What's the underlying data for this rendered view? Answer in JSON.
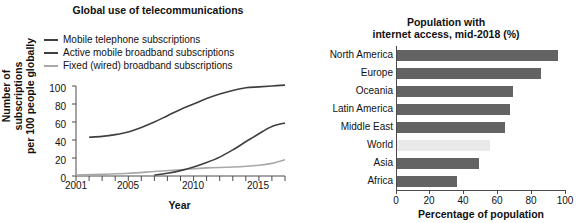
{
  "chart_data": [
    {
      "type": "line",
      "title": "Global use of telecommunications",
      "xlabel": "Year",
      "ylabel": "Number of subscriptions\nper 100 people globally",
      "ylabel_line1": "Number of subscriptions",
      "ylabel_line2": "per 100 people globally",
      "xlim": [
        2001,
        2017
      ],
      "ylim": [
        0,
        100
      ],
      "yticks": [
        100,
        80,
        60,
        40,
        20,
        0
      ],
      "xticks": [
        2001,
        2005,
        2010,
        2015
      ],
      "xtick_all": [
        2001,
        2002,
        2003,
        2004,
        2005,
        2006,
        2007,
        2008,
        2009,
        2010,
        2011,
        2012,
        2013,
        2014,
        2015,
        2016,
        2017
      ],
      "grid": false,
      "legend_position": "above-plot",
      "series": [
        {
          "name": "Mobile telephone subscriptions",
          "color": "#3f3f3f",
          "x": [
            2002,
            2003,
            2004,
            2005,
            2006,
            2007,
            2008,
            2009,
            2010,
            2011,
            2012,
            2013,
            2014,
            2015,
            2016,
            2017
          ],
          "values": [
            43,
            44,
            46,
            49,
            54,
            60,
            67,
            74,
            80,
            86,
            91,
            95,
            98,
            99,
            100,
            101
          ]
        },
        {
          "name": "Active mobile broadband subscriptions",
          "color": "#3f3f3f",
          "x": [
            2007,
            2008,
            2009,
            2010,
            2011,
            2012,
            2013,
            2014,
            2015,
            2016,
            2017
          ],
          "values": [
            1,
            3,
            6,
            10,
            15,
            21,
            29,
            38,
            47,
            55,
            59
          ]
        },
        {
          "name": "Fixed (wired) broadband subscriptions",
          "color": "#a8a8a8",
          "x": [
            2001,
            2003,
            2005,
            2007,
            2009,
            2011,
            2013,
            2015,
            2016,
            2017
          ],
          "values": [
            1,
            2,
            3,
            5,
            7,
            9,
            10,
            12,
            14,
            18
          ]
        }
      ]
    },
    {
      "type": "bar",
      "orientation": "horizontal",
      "title": "Population with\ninternet access, mid-2018 (%)",
      "title_line1": "Population with",
      "title_line2": "internet access, mid-2018 (%)",
      "xlabel": "Percentage of population",
      "ylabel": "",
      "xlim": [
        0,
        100
      ],
      "xticks": [
        0,
        20,
        40,
        60,
        80,
        100
      ],
      "grid": false,
      "categories": [
        "North America",
        "Europe",
        "Oceania",
        "Latin America",
        "Middle East",
        "World",
        "Asia",
        "Africa"
      ],
      "values": [
        95,
        85,
        69,
        67,
        64,
        55,
        49,
        36
      ],
      "colors": [
        "#636363",
        "#636363",
        "#636363",
        "#636363",
        "#636363",
        "#e9e9e9",
        "#636363",
        "#636363"
      ],
      "highlight_category": "World",
      "bar_color": "#636363",
      "highlight_color": "#e9e9e9"
    }
  ]
}
